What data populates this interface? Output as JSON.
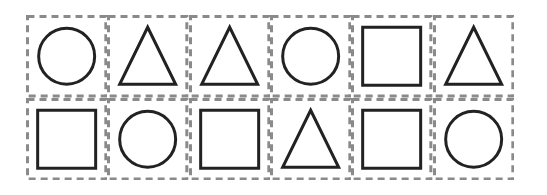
{
  "grid": {
    "rows": 2,
    "cols": 6,
    "border_color": "#8a8a8a",
    "shape_color": "#222222",
    "cells": [
      [
        "circle",
        "triangle",
        "triangle",
        "circle",
        "square",
        "triangle"
      ],
      [
        "square",
        "circle",
        "square",
        "triangle",
        "square",
        "circle"
      ]
    ]
  }
}
